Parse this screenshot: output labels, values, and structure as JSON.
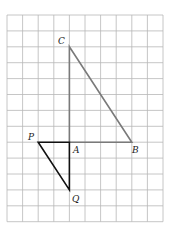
{
  "grid": {
    "cols": 10,
    "rows": 13,
    "x0": 7,
    "y0": 15,
    "cell_w": 15.6,
    "cell_h": 15.9,
    "line_color": "#b8b8b8"
  },
  "points": {
    "C": {
      "label": "C",
      "col": 4,
      "row": 2
    },
    "A": {
      "label": "A",
      "col": 4,
      "row": 8
    },
    "B": {
      "label": "B",
      "col": 8,
      "row": 8
    },
    "P": {
      "label": "P",
      "col": 2,
      "row": 8
    },
    "Q": {
      "label": "Q",
      "col": 4,
      "row": 11
    }
  },
  "triangles": [
    {
      "name": "ABC",
      "vertices": [
        "A",
        "B",
        "C"
      ],
      "color": "#7a7a7a"
    },
    {
      "name": "APQ",
      "vertices": [
        "A",
        "P",
        "Q"
      ],
      "color": "#111111"
    }
  ],
  "labels": {
    "C": "C",
    "A": "A",
    "B": "B",
    "P": "P",
    "Q": "Q"
  }
}
